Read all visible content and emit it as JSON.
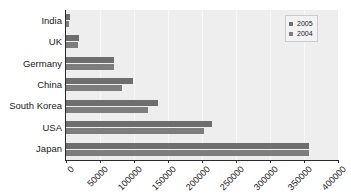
{
  "chart_data": {
    "type": "bar",
    "orientation": "horizontal",
    "title": "",
    "subtitle": "",
    "xlabel": "",
    "ylabel": "",
    "xlim": [
      0,
      400000
    ],
    "ylim": null,
    "grid": true,
    "grid_axis": "x",
    "legend_position": "top-right",
    "categories": [
      "India",
      "UK",
      "Germany",
      "China",
      "South Korea",
      "USA",
      "Japan"
    ],
    "tick_labels": [
      "0",
      "50000",
      "100000",
      "150000",
      "200000",
      "250000",
      "300000",
      "350000",
      "400000"
    ],
    "tick_values": [
      0,
      50000,
      100000,
      150000,
      200000,
      250000,
      300000,
      350000,
      400000
    ],
    "series": [
      {
        "name": "2005",
        "color": "#6e6e6e",
        "values": [
          6000,
          19000,
          70000,
          98000,
          135000,
          215000,
          358000
        ]
      },
      {
        "name": "2004",
        "color": "#7d7d7d",
        "values": [
          4000,
          17000,
          70000,
          82000,
          120000,
          203000,
          357000
        ]
      }
    ]
  },
  "legend": {
    "entries": [
      {
        "label": "2005",
        "swatch": "legend-swatch-2005"
      },
      {
        "label": "2004",
        "swatch": "legend-swatch-2004"
      }
    ]
  },
  "colors": {
    "plot_background": "#eeeeee",
    "page_background": "#ffffff",
    "axis": "#2b2b2b",
    "gridline": "#f8f8f8",
    "bar_2005": "#6e6e6e",
    "bar_2004": "#7d7d7d",
    "text": "#1a1a1a"
  }
}
